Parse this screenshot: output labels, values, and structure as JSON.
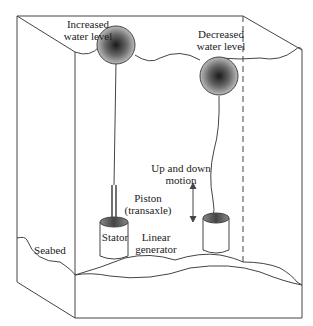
{
  "diagram": {
    "labels": {
      "increased_water_level_line1": "Increased",
      "increased_water_level_line2": "water level",
      "decreased_water_level_line1": "Decreased",
      "decreased_water_level_line2": "water level",
      "up_down_motion_line1": "Up and down",
      "up_down_motion_line2": "motion",
      "piston_line1": "Piston",
      "piston_line2": "(transaxle)",
      "stator": "Stator",
      "linear_generator_line1": "Linear",
      "linear_generator_line2": "generator",
      "seabed": "Seabed"
    },
    "colors": {
      "line": "#444444",
      "buoy_center": "#222222",
      "buoy_edge": "#aaaaaa",
      "stator_top": "#555555"
    }
  }
}
